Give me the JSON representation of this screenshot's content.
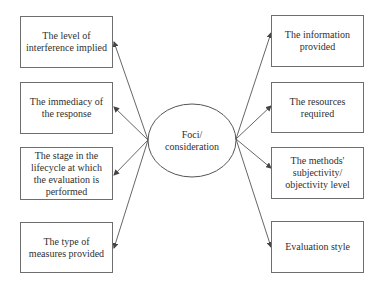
{
  "diagram": {
    "center": {
      "label": "Foci/\nconsideration"
    },
    "left_nodes": [
      {
        "label": "The level of\ninterference implied"
      },
      {
        "label": "The immediacy of\nthe response"
      },
      {
        "label": "The stage in the\nlifecycle at which\nthe evaluation is\nperformed"
      },
      {
        "label": "The type of\nmeasures provided"
      }
    ],
    "right_nodes": [
      {
        "label": "The information\nprovided"
      },
      {
        "label": "The resources\nrequired"
      },
      {
        "label": "The methods'\nsubjectivity/\nobjectivity level"
      },
      {
        "label": "Evaluation style"
      }
    ],
    "colors": {
      "line": "#555555",
      "border": "#6e6e6e",
      "text": "#2f2f2f"
    }
  }
}
